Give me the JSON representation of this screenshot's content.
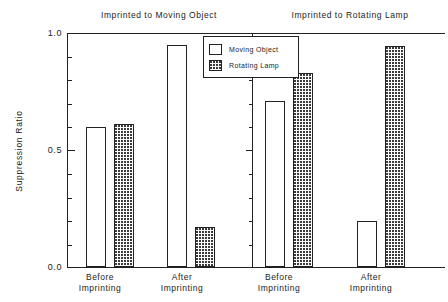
{
  "chart_data": {
    "type": "bar",
    "title": "",
    "panels": [
      {
        "title": "Imprinted to Moving Object",
        "categories": [
          "Before Imprinting",
          "After Imprinting"
        ],
        "series": [
          {
            "name": "Moving Object",
            "values": [
              0.6,
              0.95
            ]
          },
          {
            "name": "Rotating Lamp",
            "values": [
              0.61,
              0.17
            ]
          }
        ]
      },
      {
        "title": "Imprinted to Rotating Lamp",
        "categories": [
          "Before Imprinting",
          "After Imprinting"
        ],
        "series": [
          {
            "name": "Moving Object",
            "values": [
              0.71,
              0.195
            ]
          },
          {
            "name": "Rotating Lamp",
            "values": [
              0.83,
              0.945
            ]
          }
        ]
      }
    ],
    "ylabel": "Suppression Ratio",
    "xlabel": "",
    "ylim": [
      0.0,
      1.0
    ],
    "ytick_labels": [
      "0.0",
      "0.5",
      "1.0"
    ],
    "ytick_values": [
      0.0,
      0.5,
      1.0
    ],
    "yminor_step": 0.1,
    "grid": false,
    "legend": {
      "position": "top-center",
      "entries": [
        {
          "label": "Moving Object",
          "fill": "open"
        },
        {
          "label": "Rotating Lamp",
          "fill": "dotted"
        }
      ]
    },
    "colors": {
      "axis": "#222222",
      "open_fill": "#ffffff",
      "dotted_fill": "#3a3a3a",
      "text": "#1c1c1c",
      "background": "#ffffff"
    },
    "xtick_labels": [
      {
        "line1": "Before",
        "line2": "Imprinting"
      },
      {
        "line1": "After",
        "line2": "Imprinting"
      },
      {
        "line1": "Before",
        "line2": "Imprinting"
      },
      {
        "line1": "After",
        "line2": "Imprinting"
      }
    ]
  }
}
